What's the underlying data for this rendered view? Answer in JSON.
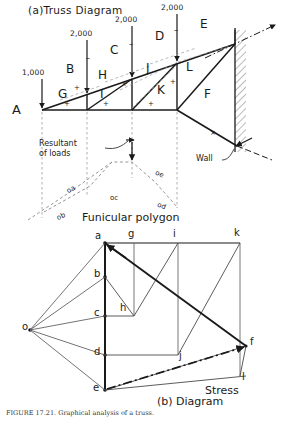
{
  "figure": {
    "caption": "FIGURE 17.21.  Graphical analysis of a truss."
  },
  "truss_diagram": {
    "title": "(a)Truss Diagram",
    "loads": [
      {
        "label": "1,000"
      },
      {
        "label": "2,000"
      },
      {
        "label": "2,000"
      },
      {
        "label": "2,000"
      }
    ],
    "upper_chord_spaces": [
      "B",
      "C",
      "D",
      "E"
    ],
    "lower_spaces": [
      "A",
      "F"
    ],
    "web_spaces": [
      "G",
      "H",
      "I",
      "J",
      "K",
      "L"
    ],
    "annotations": {
      "resultant": "Resultant\nof loads",
      "resultant_line1": "Resultant",
      "resultant_line2": "of loads",
      "wall": "Wall",
      "funicular": "Funicular  polygon"
    },
    "ray_labels": [
      "oa",
      "ob",
      "oc",
      "od",
      "oe"
    ]
  },
  "stress_diagram": {
    "title_line1": "Stress",
    "title_line2": "(b) Diagram",
    "points": [
      {
        "id": "o"
      },
      {
        "id": "a"
      },
      {
        "id": "b"
      },
      {
        "id": "c"
      },
      {
        "id": "d"
      },
      {
        "id": "e"
      },
      {
        "id": "f"
      },
      {
        "id": "g"
      },
      {
        "id": "h"
      },
      {
        "id": "i"
      },
      {
        "id": "j"
      },
      {
        "id": "k"
      },
      {
        "id": "l"
      }
    ]
  },
  "colors": {
    "ink": "#1a1a1a",
    "light_ink": "#555555",
    "paper": "#ffffff"
  }
}
